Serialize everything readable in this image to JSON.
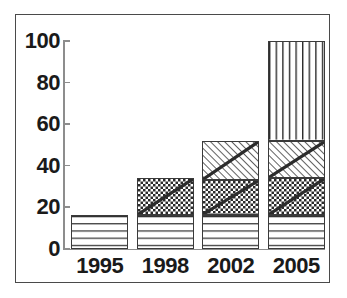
{
  "chart_data": {
    "type": "bar",
    "subtype": "stacked-bar",
    "title": "",
    "xlabel": "",
    "ylabel": "",
    "categories": [
      "1995",
      "1998",
      "2002",
      "2005"
    ],
    "ylim": [
      0,
      100
    ],
    "y_ticks": [
      0,
      20,
      40,
      60,
      80,
      100
    ],
    "y_tick_labels": [
      "0",
      "20",
      "40",
      "60",
      "80",
      "100"
    ],
    "grid": false,
    "legend": "none",
    "series": [
      {
        "name": "segment-1",
        "pattern": "horizontal-lines",
        "values": [
          16,
          16,
          16,
          16
        ]
      },
      {
        "name": "segment-2",
        "pattern": "checkerboard-with-diagonal",
        "values": [
          0,
          18,
          17,
          18
        ]
      },
      {
        "name": "segment-3",
        "pattern": "diagonal-hatch",
        "values": [
          0,
          0,
          19,
          18
        ]
      },
      {
        "name": "segment-4",
        "pattern": "vertical-lines",
        "values": [
          0,
          0,
          0,
          48
        ]
      }
    ],
    "totals": [
      16,
      34,
      52,
      100
    ],
    "stack_tops": [
      [
        16
      ],
      [
        16,
        34
      ],
      [
        16,
        33,
        52
      ],
      [
        16,
        34,
        52,
        100
      ]
    ]
  },
  "colors": {
    "frame": "#4a4a4a",
    "axis": "#8d8d8d",
    "text": "#1a1a1a",
    "bar_outline": "#3a3a3a",
    "pattern": "#2b2b2b",
    "background": "#ffffff"
  }
}
